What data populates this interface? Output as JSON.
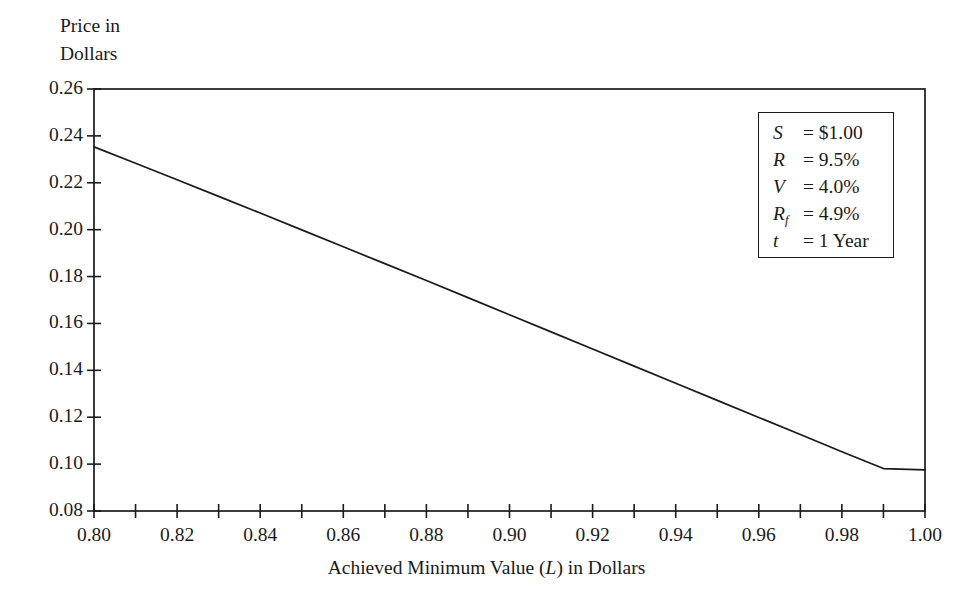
{
  "chart_data": {
    "type": "line",
    "title": "",
    "ylabel": "Price in\nDollars",
    "xlabel_prefix": "Achieved Minimum Value (",
    "xlabel_symbol": "L",
    "xlabel_suffix": ") in Dollars",
    "xlabel_full": "Achieved Minimum Value (L) in Dollars",
    "xlim": [
      0.8,
      1.0
    ],
    "ylim": [
      0.08,
      0.26
    ],
    "xticks": [
      0.8,
      0.82,
      0.84,
      0.86,
      0.88,
      0.9,
      0.92,
      0.94,
      0.96,
      0.98,
      1.0
    ],
    "xtick_labels": [
      "0.80",
      "0.82",
      "0.84",
      "0.86",
      "0.88",
      "0.90",
      "0.92",
      "0.94",
      "0.96",
      "0.98",
      "1.00"
    ],
    "xminor_step": 0.01,
    "yticks": [
      0.08,
      0.1,
      0.12,
      0.14,
      0.16,
      0.18,
      0.2,
      0.22,
      0.24,
      0.26
    ],
    "ytick_labels": [
      "0.08",
      "0.10",
      "0.12",
      "0.14",
      "0.16",
      "0.18",
      "0.20",
      "0.22",
      "0.24",
      "0.26"
    ],
    "grid": false,
    "legend_position": "upper-right-inside-box",
    "line_color": "#1a1a1a",
    "series": [
      {
        "name": "Price",
        "x": [
          0.8,
          0.81,
          0.82,
          0.83,
          0.84,
          0.85,
          0.86,
          0.87,
          0.88,
          0.89,
          0.9,
          0.91,
          0.92,
          0.93,
          0.94,
          0.95,
          0.96,
          0.97,
          0.98,
          0.99,
          1.0
        ],
        "values": [
          0.2353,
          0.2283,
          0.2213,
          0.2142,
          0.2071,
          0.1999,
          0.1927,
          0.1855,
          0.1783,
          0.171,
          0.1637,
          0.1564,
          0.1491,
          0.1418,
          0.1345,
          0.1272,
          0.1199,
          0.1126,
          0.1053,
          0.0981,
          0.0975
        ]
      }
    ]
  },
  "legend": {
    "rows": [
      {
        "symbol": "S",
        "subscript": "",
        "value": "= $1.00"
      },
      {
        "symbol": "R",
        "subscript": "",
        "value": "= 9.5%"
      },
      {
        "symbol": "V",
        "subscript": "",
        "value": "= 4.0%"
      },
      {
        "symbol": "R",
        "subscript": "f",
        "value": "= 4.9%"
      },
      {
        "symbol": "t",
        "subscript": "",
        "value": "= 1 Year"
      }
    ]
  },
  "colors": {
    "axis": "#1a1a1a",
    "line": "#1a1a1a",
    "background": "#ffffff"
  }
}
